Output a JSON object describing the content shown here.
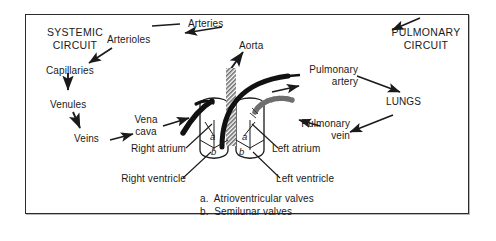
{
  "diagram": {
    "title_systemic": "SYSTEMIC\nCIRCUIT",
    "title_pulmonary": "PULMONARY\nCIRCUIT",
    "colors": {
      "stroke": "#1a1a1a",
      "vessel_dark": "#111111",
      "vessel_hatch": "#8c8c8c",
      "background": "#ffffff",
      "frame": "#2b2b2b"
    },
    "labels": {
      "arteries": "Arteries",
      "arterioles": "Arterioles",
      "capillaries": "Capillaries",
      "venules": "Venules",
      "veins": "Veins",
      "vena_cava": "Vena\ncava",
      "aorta": "Aorta",
      "pulmonary_artery": "Pulmonary\nartery",
      "pulmonary_vein": "Pulmonary\nvein",
      "lungs": "LUNGS",
      "right_atrium": "Right atrium",
      "right_ventricle": "Right ventricle",
      "left_atrium": "Left atrium",
      "left_ventricle": "Left ventricle"
    },
    "valve_markers": {
      "right_a": "a",
      "right_b": "b",
      "left_a": "a",
      "left_b": "b"
    },
    "legend": {
      "line_a": "a.  Atrioventricular valves",
      "line_b": "b.  Semilunar valves"
    }
  }
}
